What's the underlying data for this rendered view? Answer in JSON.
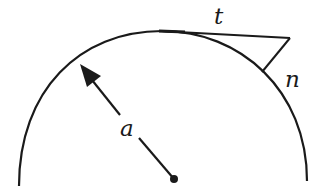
{
  "diagram": {
    "labels": {
      "tangent": "t",
      "normal": "n",
      "radius": "a"
    },
    "colors": {
      "stroke": "#1a1a1a",
      "background": "#ffffff"
    }
  }
}
